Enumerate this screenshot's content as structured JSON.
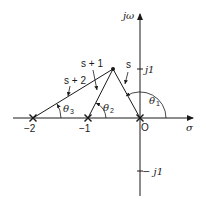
{
  "diagram": {
    "axes": {
      "horizontal_label": "σ",
      "vertical_label": "jω",
      "tick_j1": "j1",
      "tick_neg_j1": "− j1",
      "origin_label": "O",
      "tick_neg1": "−1",
      "tick_neg2": "−2"
    },
    "vectors": [
      {
        "label": "s",
        "from": "0",
        "angle_label": "θ",
        "angle_sub": "1"
      },
      {
        "label": "s + 1",
        "from": "−1",
        "angle_label": "θ",
        "angle_sub": "2"
      },
      {
        "label": "s + 2",
        "from": "−2",
        "angle_label": "θ",
        "angle_sub": "3"
      }
    ],
    "poles": [
      "0",
      "−1",
      "−2"
    ],
    "test_point": "s",
    "colors": {
      "ink": "#1a1a1a",
      "background": "#ffffff"
    }
  }
}
